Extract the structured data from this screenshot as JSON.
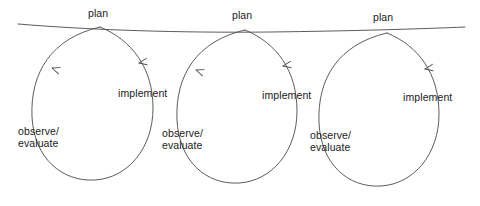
{
  "diagram": {
    "stroke_color": "#4a4a4a",
    "text_color": "#1a1a1a",
    "background_color": "#ffffff",
    "stage_names": {
      "plan": "plan",
      "implement": "implement",
      "observe_line1": "observe/",
      "observe_line2": "evaluate"
    },
    "cycles": [
      {
        "id": "cycle-1",
        "plan_label": "plan",
        "implement_label": "implement",
        "observe_label_line1": "observe/",
        "observe_label_line2": "evaluate",
        "plan_x": 88,
        "plan_y": 8,
        "implement_x": 118,
        "implement_y": 88,
        "observe_x": 18,
        "observe_y": 126,
        "loop_path": "M 100,27 C 52,38 30,72 32,117 C 34,158 62,182 95,180 C 128,178 153,148 153,108 C 153,68 132,40 100,27",
        "arrow_up_x": 52,
        "arrow_up_y": 68,
        "arrow_up_angle": -62,
        "arrow_down_x": 139,
        "arrow_down_y": 63,
        "arrow_down_angle": 72
      },
      {
        "id": "cycle-2",
        "plan_label": "plan",
        "implement_label": "implement",
        "observe_label_line1": "observe/",
        "observe_label_line2": "evaluate",
        "plan_x": 232,
        "plan_y": 10,
        "implement_x": 262,
        "implement_y": 90,
        "observe_x": 162,
        "observe_y": 128,
        "loop_path": "M 245,30 C 197,41 175,75 177,120 C 179,161 206,185 239,183 C 272,181 297,151 297,111 C 297,71 277,43 245,30",
        "arrow_up_x": 196,
        "arrow_up_y": 70,
        "arrow_up_angle": -62,
        "arrow_down_x": 283,
        "arrow_down_y": 66,
        "arrow_down_angle": 72
      },
      {
        "id": "cycle-3",
        "plan_label": "plan",
        "implement_label": "implement",
        "observe_label_line1": "observe/",
        "observe_label_line2": "evaluate",
        "plan_x": 373,
        "plan_y": 12,
        "implement_x": 403,
        "implement_y": 92,
        "observe_x": 310,
        "observe_y": 130,
        "loop_path": "M 387,33 C 339,44 317,78 319,123 C 321,164 348,188 381,186 C 414,184 439,154 439,114 C 439,74 419,46 387,33",
        "arrow_up_x": 0,
        "arrow_up_y": 0,
        "arrow_up_angle": 0,
        "arrow_down_x": 425,
        "arrow_down_y": 69,
        "arrow_down_angle": 72,
        "has_up_arrow": false
      }
    ],
    "progression_line": {
      "name": "time-progression-line",
      "path": "M 18,24 C 90,30 180,33 270,32 C 350,31 420,29 465,27"
    }
  }
}
